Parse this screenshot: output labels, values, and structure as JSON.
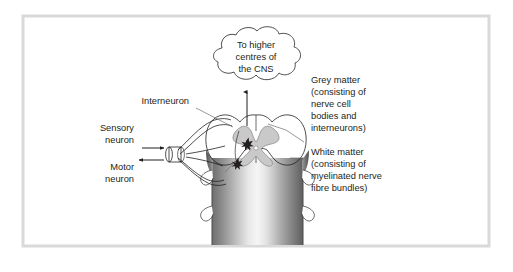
{
  "figure": {
    "name": "spinal-cord-reflex-arc-diagram",
    "background_color": "#ffffff",
    "frame_color": "#d9d9d9",
    "ink_color": "#231f20",
    "grey_matter_color": "#c9c9c9",
    "white_matter_color": "#b3b3b3"
  },
  "callout": {
    "shape": "cloud",
    "line1": "To higher",
    "line2": "centres of",
    "line3": "the CNS"
  },
  "labels": {
    "interneuron": "Interneuron",
    "sensory_line1": "Sensory",
    "sensory_line2": "neuron",
    "motor_line1": "Motor",
    "motor_line2": "neuron",
    "grey_matter_line1": "Grey matter",
    "grey_matter_line2": "(consisting of",
    "grey_matter_line3": "nerve cell",
    "grey_matter_line4": "bodies and",
    "grey_matter_line5": "interneurons)",
    "white_matter_line1": "White matter",
    "white_matter_line2": "(consisting of",
    "white_matter_line3": "myelinated nerve",
    "white_matter_line4": "fibre bundles)"
  },
  "arrows": {
    "to_cns": "arrow-up-to-cns",
    "sensory_in": "arrow-right-sensory-input",
    "motor_out": "arrow-left-motor-output"
  },
  "structures": {
    "spinal_cord_shaft": "spinal-cord-shaft",
    "grey_matter": "grey-matter-butterfly",
    "white_matter": "white-matter-region",
    "central_canal": "central-canal",
    "dorsal_root_ganglion": "dorsal-root-ganglion",
    "synapse_1": "synapse-node",
    "synapse_2": "synapse-node"
  }
}
